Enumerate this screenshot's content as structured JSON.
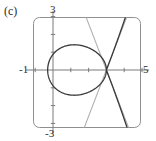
{
  "figure": {
    "panel_label": "(c)",
    "background_color": "#ffffff"
  },
  "chart_data": {
    "type": "line",
    "title": "",
    "subtitle": "",
    "xlabel": "",
    "ylabel": "",
    "panel": "(c)",
    "grid": false,
    "legend": null,
    "legend_position": "none",
    "xlim": [
      -1,
      5
    ],
    "ylim": [
      -3,
      3
    ],
    "axis_tick_labels": {
      "top": "3",
      "left": "-1",
      "right": "5",
      "bottom": "-3"
    },
    "tick_labels": [
      "-1",
      "3",
      "5",
      "-3"
    ],
    "x_ticks": [
      -1,
      0,
      1,
      2,
      3,
      4,
      5
    ],
    "y_ticks": [
      -3,
      -2,
      -1,
      0,
      1,
      2,
      3
    ],
    "frame": {
      "rounded_corners": true,
      "color": "#8a8a8a"
    },
    "axis_color": "#7a7a7a",
    "series": [
      {
        "name": "curve",
        "description": "closed loop with node crossing and two outward branches",
        "color": "#3a3a3a",
        "width": 1.3,
        "node_point": [
          3,
          0
        ],
        "loop_left_x": -0.3,
        "loop_top_y": 1.55,
        "loop_bottom_y": -1.55
      },
      {
        "name": "tangent-line-1",
        "description": "tangent at node, positive slope",
        "color": "#b0b0b0",
        "width": 1.1,
        "through": [
          3,
          0
        ],
        "slope": 2.6
      },
      {
        "name": "tangent-line-2",
        "description": "tangent at node, negative slope",
        "color": "#b0b0b0",
        "width": 1.1,
        "through": [
          3,
          0
        ],
        "slope": -2.6
      }
    ]
  }
}
